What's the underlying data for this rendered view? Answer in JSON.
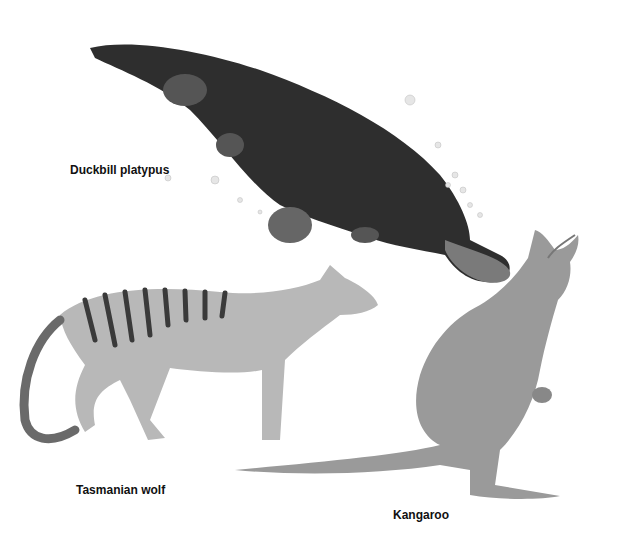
{
  "labels": {
    "platypus": "Duckbill platypus",
    "wolf": "Tasmanian wolf",
    "kangaroo": "Kangaroo"
  },
  "colors": {
    "background": "#ffffff",
    "platypus_fill": "#2e2e2e",
    "wolf_fill": "#b8b8b8",
    "wolf_stripes": "#3a3a3a",
    "kangaroo_fill": "#9a9a9a"
  }
}
